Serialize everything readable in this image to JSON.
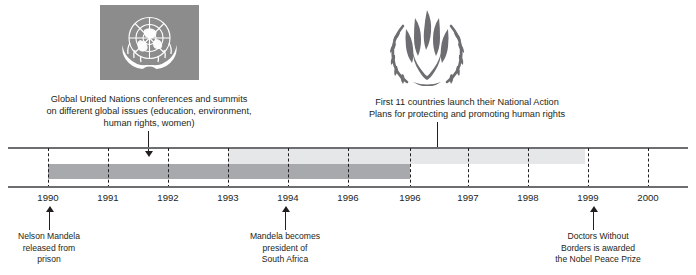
{
  "emblems": [
    {
      "name": "united-nations-emblem",
      "alt": "United Nations emblem"
    },
    {
      "name": "un-human-rights-emblem",
      "alt": "UN Human Rights emblem"
    }
  ],
  "callouts_top": [
    {
      "id": "un-conferences",
      "text": "Global United Nations conferences and summits\non different global issues (education, environment,\nhuman rights, women)"
    },
    {
      "id": "national-action-plans",
      "text": "First 11 countries launch their National Action\nPlans for protecting and promoting human rights"
    }
  ],
  "callouts_bottom": [
    {
      "id": "mandela-released",
      "text": "Nelson Mandela\nreleased from\nprison"
    },
    {
      "id": "mandela-president",
      "text": "Mandela becomes\npresident of\nSouth Africa"
    },
    {
      "id": "msf-nobel",
      "text": "Doctors Without\nBorders is awarded\nthe Nobel Peace Prize"
    }
  ],
  "chart_data": {
    "type": "timeline",
    "title": "",
    "xlabel": "",
    "ylabel": "",
    "axis_range": [
      1990,
      2000
    ],
    "grid": true,
    "legend": "none",
    "tick_labels": [
      "1990",
      "1991",
      "1992",
      "1993",
      "1994",
      "1996",
      "1996",
      "1997",
      "1998",
      "1999",
      "2000"
    ],
    "tick_x": [
      48,
      108,
      168,
      228,
      288,
      348,
      410,
      468,
      528,
      588,
      648
    ],
    "bars": [
      {
        "id": "dark-band",
        "label": "",
        "color": "#a7a9ac",
        "start_x": 48,
        "end_x": 410,
        "row": "lower"
      },
      {
        "id": "light-band",
        "label": "",
        "color": "#e6e7e8",
        "start_x": 228,
        "end_x": 585,
        "row": "upper"
      }
    ],
    "events": [
      {
        "label": "Nelson Mandela released from prison",
        "x": 48,
        "side": "bottom"
      },
      {
        "label": "Mandela becomes president of South Africa",
        "x": 285,
        "side": "bottom"
      },
      {
        "label": "Doctors Without Borders is awarded the Nobel Peace Prize",
        "x": 592,
        "side": "bottom"
      },
      {
        "label": "Global United Nations conferences and summits on different global issues (education, environment, human rights, women)",
        "x": 148,
        "side": "top"
      },
      {
        "label": "First 11 countries launch their National Action Plans for protecting and promoting human rights",
        "x": 437,
        "side": "top"
      }
    ]
  }
}
